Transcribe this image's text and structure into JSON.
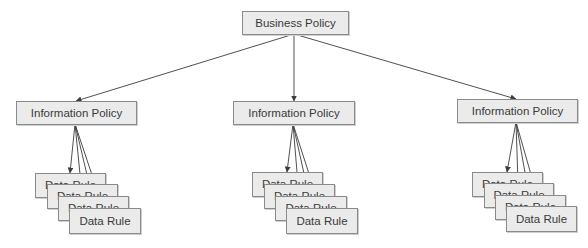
{
  "diagram": {
    "colors": {
      "node_fill": "#ebebeb",
      "node_border": "#8a8a8a",
      "text": "#3a3a3a",
      "edge": "#3c3c3c"
    },
    "root": {
      "label": "Business Policy"
    },
    "groups": [
      {
        "policy": {
          "label": "Information Policy"
        },
        "rules": [
          {
            "label": "Data Rule"
          },
          {
            "label": "Data Rule"
          },
          {
            "label": "Data Rule"
          },
          {
            "label": "Data Rule"
          }
        ]
      },
      {
        "policy": {
          "label": "Information Policy"
        },
        "rules": [
          {
            "label": "Data Rule"
          },
          {
            "label": "Data Rule"
          },
          {
            "label": "Data Rule"
          },
          {
            "label": "Data Rule"
          }
        ]
      },
      {
        "policy": {
          "label": "Information Policy"
        },
        "rules": [
          {
            "label": "Data Rule"
          },
          {
            "label": "Data Rule"
          },
          {
            "label": "Data Rule"
          },
          {
            "label": "Data Rule"
          }
        ]
      }
    ],
    "edges": [
      {
        "from": "Business Policy",
        "to": "Information Policy (left)"
      },
      {
        "from": "Business Policy",
        "to": "Information Policy (middle)"
      },
      {
        "from": "Business Policy",
        "to": "Information Policy (right)"
      },
      {
        "from": "Information Policy (left)",
        "to": "Data Rule x4"
      },
      {
        "from": "Information Policy (middle)",
        "to": "Data Rule x4"
      },
      {
        "from": "Information Policy (right)",
        "to": "Data Rule x4"
      }
    ]
  }
}
